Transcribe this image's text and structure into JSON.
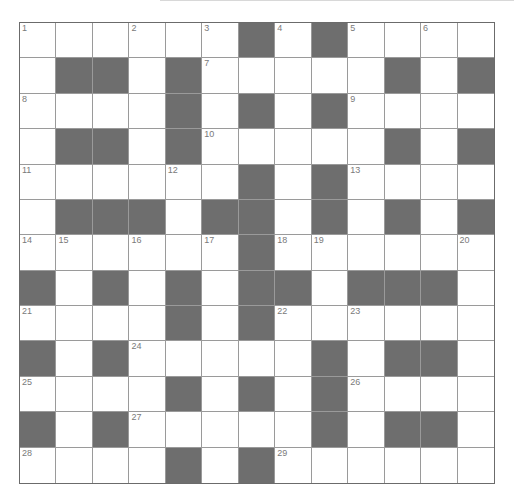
{
  "puzzle": {
    "rows": 13,
    "cols": 13,
    "colors": {
      "block": "#6e6e6e",
      "cell": "#ffffff",
      "gridline": "#9a9a9a",
      "border": "#6b6b6b",
      "number": "#7a7a7a"
    },
    "grid": [
      [
        "1",
        "",
        "",
        "2",
        "",
        "3",
        "#",
        "4",
        "#",
        "5",
        "",
        "6",
        ""
      ],
      [
        "",
        "#",
        "#",
        "",
        "#",
        "7",
        "",
        "",
        "",
        "",
        "#",
        "",
        "#"
      ],
      [
        "8",
        "",
        "",
        "",
        "#",
        "",
        "#",
        "",
        "#",
        "9",
        "",
        "",
        ""
      ],
      [
        "",
        "#",
        "#",
        "",
        "#",
        "10",
        "",
        "",
        "",
        "",
        "#",
        "",
        "#"
      ],
      [
        "11",
        "",
        "",
        "",
        "12",
        "",
        "#",
        "",
        "#",
        "13",
        "",
        "",
        ""
      ],
      [
        "",
        "#",
        "#",
        "#",
        "",
        "#",
        "#",
        "",
        "#",
        "",
        "#",
        "",
        "#"
      ],
      [
        "14",
        "15",
        "",
        "16",
        "",
        "17",
        "#",
        "18",
        "19",
        "",
        "",
        "",
        "20"
      ],
      [
        "#",
        "",
        "#",
        "",
        "#",
        "",
        "#",
        "#",
        "",
        "#",
        "#",
        "#",
        ""
      ],
      [
        "21",
        "",
        "",
        "",
        "#",
        "",
        "#",
        "22",
        "",
        "23",
        "",
        "",
        ""
      ],
      [
        "#",
        "",
        "#",
        "24",
        "",
        "",
        "",
        "",
        "#",
        "",
        "#",
        "#",
        ""
      ],
      [
        "25",
        "",
        "",
        "",
        "#",
        "",
        "#",
        "",
        "#",
        "26",
        "",
        "",
        ""
      ],
      [
        "#",
        "",
        "#",
        "27",
        "",
        "",
        "",
        "",
        "#",
        "",
        "#",
        "#",
        ""
      ],
      [
        "28",
        "",
        "",
        "",
        "#",
        "",
        "#",
        "29",
        "",
        "",
        "",
        "",
        ""
      ]
    ]
  }
}
